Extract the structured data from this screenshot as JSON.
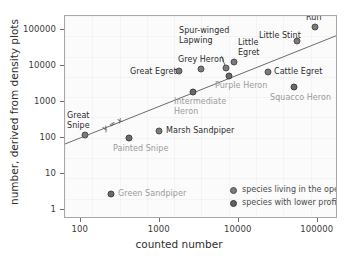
{
  "chart_data": {
    "type": "scatter",
    "title": "",
    "xlabel": "counted number",
    "ylabel": "number, derived from density plots",
    "xscale": "log",
    "yscale": "log",
    "xlim": [
      63,
      180000
    ],
    "ylim": [
      0.55,
      240000
    ],
    "xticks": [
      100,
      1000,
      10000,
      100000
    ],
    "xticklabels": [
      "100",
      "1000",
      "10000",
      "100000"
    ],
    "yticks": [
      1,
      10,
      100,
      1000,
      10000,
      100000
    ],
    "yticklabels": [
      "1",
      "10",
      "100",
      "1000",
      "10000",
      "100000"
    ],
    "grid": true,
    "reference_line": {
      "label": "y = x",
      "equation": "y = x"
    },
    "legend": {
      "position": "bottom-right-inside",
      "entries": [
        {
          "key": "open",
          "label": "species living in the open"
        },
        {
          "key": "low",
          "label": "species with lower profile"
        }
      ]
    },
    "series": [
      {
        "name": "species living in the open",
        "key": "open",
        "points": [
          {
            "label": "Great\nSnipe",
            "x": 115,
            "y": 150,
            "px": 84,
            "py": 134,
            "lx": 66,
            "ly": 110,
            "align": "left"
          },
          {
            "label": "Great Egret",
            "x": 1600,
            "y": 5500,
            "px": 178,
            "py": 70,
            "lx": 129,
            "ly": 66,
            "align": "left"
          },
          {
            "label": "Grey Heron",
            "x": 3200,
            "y": 6500,
            "px": 200,
            "py": 68,
            "lx": 177,
            "ly": 54,
            "align": "left"
          },
          {
            "label": "Spur-winged\nLapwing",
            "x": 6200,
            "y": 7200,
            "px": 225,
            "py": 67,
            "lx": 178,
            "ly": 25,
            "align": "left"
          },
          {
            "label": "Little\nEgret",
            "x": 7800,
            "y": 11500,
            "px": 233,
            "py": 61,
            "lx": 237,
            "ly": 37,
            "align": "left"
          },
          {
            "label": "Little Stint",
            "x": 44000,
            "y": 41000,
            "px": 296,
            "py": 40,
            "lx": 258,
            "ly": 30,
            "align": "left"
          },
          {
            "label": "Ruff",
            "x": 80000,
            "y": 95000,
            "px": 314,
            "py": 26,
            "lx": 305,
            "ly": 12,
            "align": "left"
          },
          {
            "label": "Cattle Egret",
            "x": 19000,
            "y": 5600,
            "px": 267,
            "py": 71,
            "lx": 273,
            "ly": 66,
            "align": "left"
          },
          {
            "label": "Marsh Sandpiper",
            "x": 950,
            "y": 200,
            "px": 158,
            "py": 130,
            "lx": 165,
            "ly": 125,
            "align": "left"
          }
        ]
      },
      {
        "name": "species with lower profile",
        "key": "low",
        "points": [
          {
            "label": "Painted Snipe",
            "x": 420,
            "y": 105,
            "px": 128,
            "py": 137,
            "lx": 112,
            "ly": 143,
            "align": "left"
          },
          {
            "label": "Green Sandpiper",
            "x": 250,
            "y": 2,
            "px": 110,
            "py": 193,
            "lx": 117,
            "ly": 188,
            "align": "left"
          },
          {
            "label": "Intermediate\nHeron",
            "x": 2500,
            "y": 1600,
            "px": 192,
            "py": 91,
            "lx": 173,
            "ly": 96,
            "align": "left"
          },
          {
            "label": "Purple Heron",
            "x": 7800,
            "y": 4800,
            "px": 228,
            "py": 75,
            "lx": 214,
            "ly": 80,
            "align": "left"
          },
          {
            "label": "Squacco Heron",
            "x": 44000,
            "y": 1700,
            "px": 293,
            "py": 86,
            "lx": 269,
            "ly": 92,
            "align": "left"
          }
        ]
      }
    ]
  },
  "axes": {
    "xlabel": "counted number",
    "ylabel": "number, derived from density plots"
  },
  "reference": {
    "label": "y = x"
  },
  "legend": {
    "open_label": "species living in the open",
    "low_label": "species with lower profile"
  }
}
